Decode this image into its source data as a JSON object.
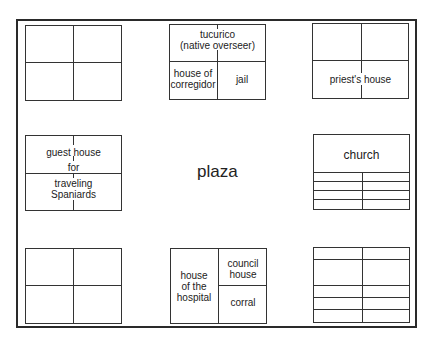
{
  "title": "plaza",
  "blocks": {
    "top_left": {
      "labels": []
    },
    "top_middle": {
      "top_label_line1": "tucurico",
      "top_label_line2": "(native overseer)",
      "bottom_left_line1": "house of",
      "bottom_left_line2": "corregidor",
      "bottom_right": "jail"
    },
    "top_right": {
      "label": "priest's house"
    },
    "middle_left": {
      "line1": "guest house",
      "line2": "for",
      "line3": "traveling",
      "line4": "Spaniards"
    },
    "middle_right": {
      "label": "church"
    },
    "bottom_left": {
      "labels": []
    },
    "bottom_middle": {
      "left_line1": "house",
      "left_line2": "of the",
      "left_line3": "hospital",
      "right_top_line1": "council",
      "right_top_line2": "house",
      "right_bottom": "corral"
    },
    "bottom_right": {
      "labels": []
    }
  },
  "colors": {
    "line": "#333333",
    "background": "#ffffff",
    "text": "#222222"
  }
}
